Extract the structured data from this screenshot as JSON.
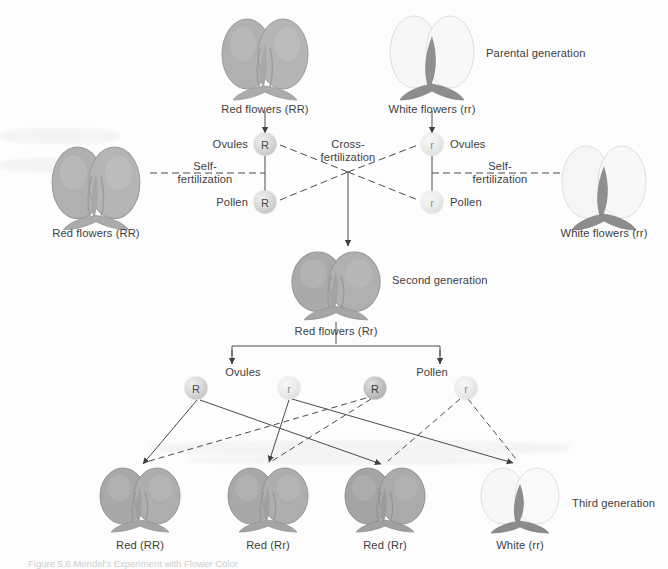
{
  "figure": {
    "caption": "Figure 5.6 Mendel's Experiment with Flower Color",
    "domain_note": "genetics inheritance pedigree diagram"
  },
  "colors": {
    "red_flower": "#a9a9a9",
    "white_flower": "#f4f4f4",
    "stem": "#8e8e8e",
    "line": "#4a4a4a",
    "text": "#3d3d3d",
    "background": "#fdfdfd"
  },
  "generations": {
    "parental_label": "Parental generation",
    "second_label": "Second generation",
    "third_label": "Third generation"
  },
  "fertilization": {
    "cross_line1": "Cross-",
    "cross_line2": "fertilization",
    "self_line1": "Self-",
    "self_line2": "fertilization"
  },
  "gamete_roles": {
    "ovules": "Ovules",
    "pollen": "Pollen"
  },
  "parental": {
    "left_outer": {
      "label": "Red flowers (RR)",
      "type": "red"
    },
    "center_red": {
      "label": "Red flowers (RR)",
      "type": "red"
    },
    "center_white": {
      "label": "White flowers (rr)",
      "type": "white"
    },
    "right_outer": {
      "label": "White flowers (rr)",
      "type": "white"
    },
    "gametes": [
      {
        "allele": "R",
        "role": "Ovules",
        "parent": "red"
      },
      {
        "allele": "R",
        "role": "Pollen",
        "parent": "red"
      },
      {
        "allele": "r",
        "role": "Ovules",
        "parent": "white"
      },
      {
        "allele": "r",
        "role": "Pollen",
        "parent": "white"
      }
    ]
  },
  "second_generation": {
    "label": "Red flowers (Rr)",
    "type": "red",
    "gametes": [
      {
        "allele": "R",
        "role": "Ovules"
      },
      {
        "allele": "r",
        "role": "Ovules"
      },
      {
        "allele": "R",
        "role": "Pollen"
      },
      {
        "allele": "r",
        "role": "Pollen"
      }
    ]
  },
  "third_generation": {
    "offspring": [
      {
        "label": "Red (RR)",
        "type": "red",
        "genotype": "RR"
      },
      {
        "label": "Red (Rr)",
        "type": "red",
        "genotype": "Rr"
      },
      {
        "label": "Red (Rr)",
        "type": "red",
        "genotype": "Rr"
      },
      {
        "label": "White (rr)",
        "type": "white",
        "genotype": "rr"
      }
    ]
  }
}
